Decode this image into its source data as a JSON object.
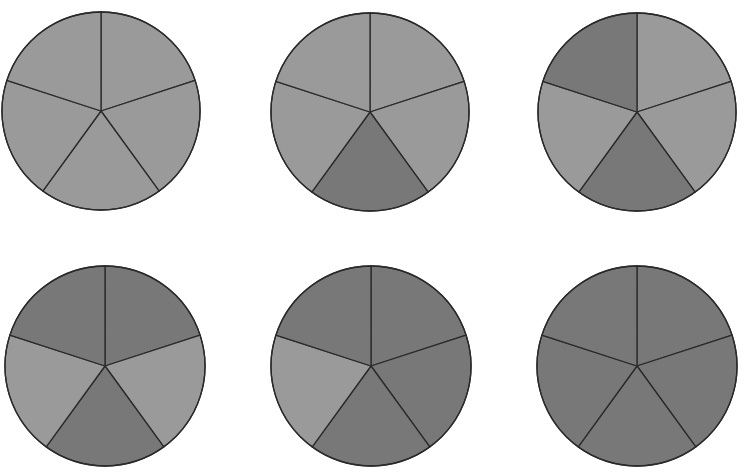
{
  "chart_data": {
    "type": "pie",
    "title": "",
    "colors": {
      "light": "#9a9a9a",
      "dark": "#787878",
      "stroke": "#2a2a2a"
    },
    "sector_order": [
      "top-right",
      "right",
      "bottom",
      "left",
      "top-left"
    ],
    "pies": [
      {
        "id": 1,
        "cx": 101,
        "cy": 111,
        "r": 99,
        "shaded": [
          false,
          false,
          false,
          false,
          false
        ],
        "shaded_count": 0,
        "total": 5
      },
      {
        "id": 2,
        "cx": 370,
        "cy": 112,
        "r": 99,
        "shaded": [
          false,
          false,
          true,
          false,
          false
        ],
        "shaded_count": 1,
        "total": 5
      },
      {
        "id": 3,
        "cx": 637,
        "cy": 112,
        "r": 99,
        "shaded": [
          false,
          false,
          true,
          false,
          true
        ],
        "shaded_count": 2,
        "total": 5
      },
      {
        "id": 4,
        "cx": 105,
        "cy": 366,
        "r": 100,
        "shaded": [
          true,
          false,
          true,
          false,
          true
        ],
        "shaded_count": 3,
        "total": 5
      },
      {
        "id": 5,
        "cx": 371,
        "cy": 366,
        "r": 100,
        "shaded": [
          true,
          true,
          true,
          false,
          true
        ],
        "shaded_count": 4,
        "total": 5
      },
      {
        "id": 6,
        "cx": 637,
        "cy": 366,
        "r": 100,
        "shaded": [
          true,
          true,
          true,
          true,
          true
        ],
        "shaded_count": 5,
        "total": 5
      }
    ]
  }
}
